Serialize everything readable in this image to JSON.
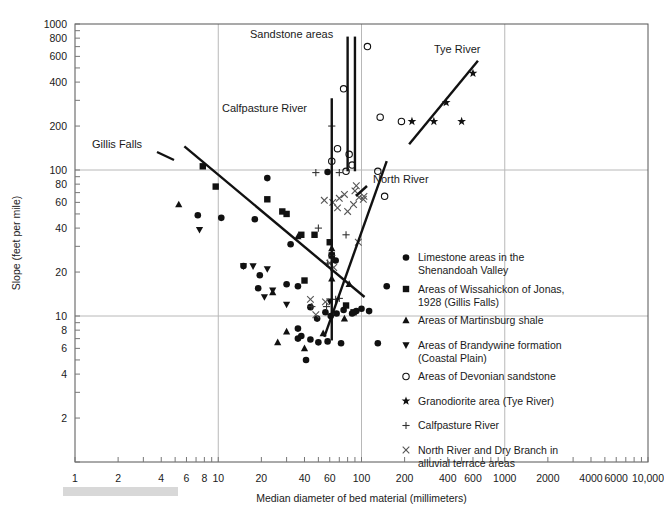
{
  "chart_data": {
    "type": "scatter",
    "title": "",
    "xlabel": "Median diameter of bed material (millimeters)",
    "ylabel": "Slope (feet per mile)",
    "xscale": "log",
    "yscale": "log",
    "xlim": [
      1,
      10000
    ],
    "ylim": [
      1,
      1000
    ],
    "grid": true,
    "xticks": [
      1,
      2,
      4,
      6,
      8,
      10,
      20,
      40,
      60,
      100,
      200,
      400,
      600,
      1000,
      2000,
      4000,
      6000,
      10000
    ],
    "xticklabels": [
      "1",
      "2",
      "4",
      "6",
      "8",
      "10",
      "20",
      "40",
      "60",
      "100",
      "200",
      "400",
      "600",
      "1000",
      "2000",
      "4000",
      "6000",
      "10,000"
    ],
    "yticks": [
      2,
      4,
      6,
      8,
      10,
      20,
      40,
      60,
      80,
      100,
      200,
      400,
      600,
      800,
      1000
    ],
    "yticklabels": [
      "2",
      "4",
      "6",
      "8",
      "10",
      "20",
      "40",
      "60",
      "80",
      "100",
      "200",
      "400",
      "600",
      "800",
      "1000"
    ],
    "gridlines_x": [
      10,
      100,
      1000
    ],
    "gridlines_y": [
      10,
      100
    ],
    "legend_position": "inside-lower-right",
    "series": [
      {
        "name": "Limestone areas in the Shenandoah Valley",
        "marker": "circle-filled",
        "points": [
          [
            7.2,
            49
          ],
          [
            10.5,
            47
          ],
          [
            18.0,
            46
          ],
          [
            15.0,
            22
          ],
          [
            19.5,
            19
          ],
          [
            19.0,
            15.5
          ],
          [
            30.0,
            16.5
          ],
          [
            36.0,
            16.0
          ],
          [
            22.0,
            88
          ],
          [
            32.0,
            31
          ],
          [
            62.0,
            26
          ],
          [
            66.0,
            24
          ],
          [
            58.0,
            97
          ],
          [
            44.0,
            11.5
          ],
          [
            49.0,
            9.6
          ],
          [
            56.0,
            10.6
          ],
          [
            61.0,
            10.0
          ],
          [
            67.0,
            10.4
          ],
          [
            75.0,
            11.0
          ],
          [
            86.0,
            10.4
          ],
          [
            92.0,
            10.8
          ],
          [
            100.0,
            11.2
          ],
          [
            113.0,
            10.8
          ],
          [
            38.0,
            7.3
          ],
          [
            44.0,
            6.9
          ],
          [
            50.0,
            6.6
          ],
          [
            58.0,
            6.7
          ],
          [
            41.0,
            5.0
          ],
          [
            72.0,
            6.5
          ],
          [
            130.0,
            6.5
          ],
          [
            150.0,
            16.0
          ],
          [
            36.0,
            8.2
          ],
          [
            36.0,
            7.0
          ]
        ]
      },
      {
        "name": "Areas of Wissahickon of Jonas, 1928 (Gillis Falls)",
        "marker": "square-filled",
        "points": [
          [
            7.8,
            106
          ],
          [
            9.6,
            77
          ],
          [
            22.0,
            63
          ],
          [
            28.0,
            52
          ],
          [
            30.0,
            50
          ],
          [
            38.0,
            36
          ],
          [
            47.0,
            36
          ],
          [
            60.0,
            32
          ],
          [
            62.0,
            26
          ],
          [
            40.0,
            17.5
          ],
          [
            78.0,
            11.8
          ],
          [
            88.0,
            10.6
          ]
        ]
      },
      {
        "name": "Areas of Martinsburg shale",
        "marker": "triangle-up",
        "points": [
          [
            5.3,
            58
          ],
          [
            36.0,
            35
          ],
          [
            62.0,
            29
          ],
          [
            24.0,
            14.5
          ],
          [
            30.0,
            7.8
          ],
          [
            26.0,
            6.6
          ],
          [
            40.0,
            6.0
          ],
          [
            54.0,
            7.6
          ],
          [
            76.0,
            9.6
          ],
          [
            82.0,
            16.5
          ],
          [
            62.0,
            18.0
          ]
        ]
      },
      {
        "name": "Areas of Brandywine formation (Coastal Plain)",
        "marker": "triangle-down",
        "points": [
          [
            7.4,
            39
          ],
          [
            15.0,
            22
          ],
          [
            17.5,
            22
          ],
          [
            22.0,
            21
          ],
          [
            24.0,
            15.0
          ],
          [
            21.0,
            13.5
          ],
          [
            30.0,
            12.0
          ],
          [
            60.0,
            12.6
          ]
        ]
      },
      {
        "name": "Areas of Devonian sandstone",
        "marker": "circle-open",
        "points": [
          [
            75.0,
            360
          ],
          [
            68.0,
            140
          ],
          [
            82.0,
            128
          ],
          [
            86.0,
            108
          ],
          [
            62.0,
            115
          ],
          [
            78.0,
            98
          ],
          [
            110.0,
            700
          ],
          [
            135.0,
            230
          ],
          [
            130.0,
            98
          ],
          [
            145.0,
            66
          ],
          [
            190.0,
            215
          ]
        ]
      },
      {
        "name": "Granodiorite area (Tye River)",
        "marker": "star",
        "points": [
          [
            225.0,
            215
          ],
          [
            320.0,
            215
          ],
          [
            390.0,
            290
          ],
          [
            500.0,
            215
          ],
          [
            600.0,
            460
          ]
        ]
      },
      {
        "name": "Calfpasture River",
        "marker": "plus",
        "points": [
          [
            62.0,
            200
          ],
          [
            48.0,
            96
          ],
          [
            70.0,
            96
          ],
          [
            50.0,
            40
          ],
          [
            62.0,
            26
          ],
          [
            58.0,
            23
          ],
          [
            66.0,
            13.0
          ],
          [
            70.0,
            13.2
          ],
          [
            57.0,
            11.6
          ],
          [
            45.0,
            11.6
          ],
          [
            78.0,
            36
          ]
        ]
      },
      {
        "name": "North River and Dry Branch in alluvial terrace areas",
        "marker": "cross",
        "points": [
          [
            90.0,
            72
          ],
          [
            96.0,
            65
          ],
          [
            103.0,
            63
          ],
          [
            88.0,
            58
          ],
          [
            76.0,
            68
          ],
          [
            70.0,
            64
          ],
          [
            55.0,
            62
          ],
          [
            63.0,
            60
          ],
          [
            68.0,
            55
          ],
          [
            80.0,
            52
          ],
          [
            92.0,
            78
          ],
          [
            60.0,
            23
          ],
          [
            64.0,
            21.5
          ],
          [
            56.0,
            12.5
          ],
          [
            48.0,
            10.2
          ],
          [
            104.0,
            66
          ],
          [
            95.0,
            32
          ],
          [
            44.0,
            13.0
          ]
        ]
      }
    ],
    "trend_lines": [
      {
        "name": "Gillis Falls",
        "p1": [
          5.8,
          145
        ],
        "p2": [
          105.0,
          13.5
        ]
      },
      {
        "name": "North River",
        "p1": [
          55.0,
          7.2
        ],
        "p2": [
          150.0,
          115
        ]
      },
      {
        "name": "Tye River",
        "p1": [
          215.0,
          150
        ],
        "p2": [
          650.0,
          560
        ]
      }
    ],
    "vertical_lines": [
      {
        "name": "Calfpasture River",
        "x": 62.0,
        "y1": 6.8,
        "y2": 310
      },
      {
        "name": "Sandstone areas",
        "x": 80.0,
        "y1": 98,
        "y2": 820
      },
      {
        "name": "Sandstone areas 2",
        "x": 90.0,
        "y1": 98,
        "y2": 820
      }
    ],
    "annotations": [
      {
        "text": "Sandstone areas",
        "x": 250,
        "y": 38
      },
      {
        "text": "Calfpasture River",
        "x": 222,
        "y": 112
      },
      {
        "text": "Gillis Falls",
        "x": 92,
        "y": 148
      },
      {
        "text": "Tye River",
        "x": 434,
        "y": 53
      },
      {
        "text": "North River",
        "x": 373,
        "y": 183
      }
    ],
    "legend_entries": [
      {
        "marker": "circle-filled",
        "label_line1": "Limestone areas in the",
        "label_line2": "Shenandoah Valley"
      },
      {
        "marker": "square-filled",
        "label_line1": "Areas of Wissahickon of Jonas,",
        "label_line2": "1928 (Gillis Falls)"
      },
      {
        "marker": "triangle-up",
        "label_line1": "Areas of Martinsburg shale",
        "label_line2": ""
      },
      {
        "marker": "triangle-down",
        "label_line1": "Areas of Brandywine formation",
        "label_line2": "(Coastal Plain)"
      },
      {
        "marker": "circle-open",
        "label_line1": "Areas of Devonian sandstone",
        "label_line2": ""
      },
      {
        "marker": "star",
        "label_line1": "Granodiorite area (Tye River)",
        "label_line2": ""
      },
      {
        "marker": "plus",
        "label_line1": "Calfpasture River",
        "label_line2": ""
      },
      {
        "marker": "cross",
        "label_line1": "North River and Dry Branch in",
        "label_line2": "alluvial terrace areas"
      }
    ]
  }
}
